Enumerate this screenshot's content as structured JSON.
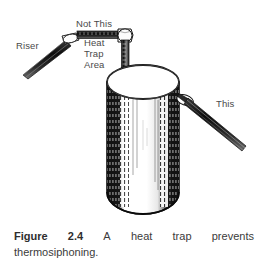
{
  "figure": {
    "labels": {
      "riser": "Riser",
      "not_this": "Not This",
      "this": "This",
      "heat_trap_line1": "Heat",
      "heat_trap_line2": "Trap",
      "heat_trap_line3": "Area"
    },
    "colors": {
      "ink": "#1a1a1a",
      "label_text": "#4a4a4a",
      "caption_text": "#3b3b3b",
      "background": "#ffffff"
    }
  },
  "caption": {
    "figure_word": "Figure",
    "figure_number": "2.4",
    "words": [
      "A",
      "heat",
      "trap",
      "prevents"
    ],
    "line2": "thermosiphoning."
  }
}
